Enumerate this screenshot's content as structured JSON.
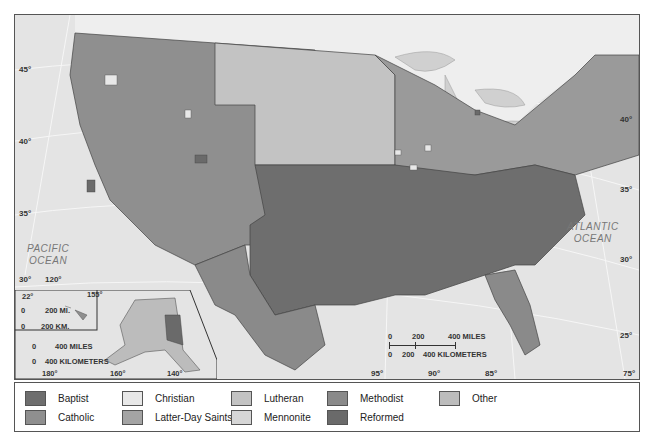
{
  "map": {
    "title": "Religious affiliation by county, United States",
    "ocean_labels": [
      {
        "line1": "PACIFIC",
        "line2": "OCEAN"
      },
      {
        "line1": "ATLANTIC",
        "line2": "OCEAN"
      }
    ],
    "latitude_labels_left": [
      "45°",
      "40°",
      "35°",
      "30°"
    ],
    "latitude_labels_right": [
      "40°",
      "35°",
      "30°",
      "25°"
    ],
    "longitude_labels_bottom": [
      "120°",
      "95°",
      "90°",
      "85°",
      "75°"
    ],
    "main_scale": {
      "miles_ticks": [
        "0",
        "200",
        "400 MILES"
      ],
      "km_ticks": [
        "0",
        "200",
        "400 KILOMETERS"
      ]
    },
    "inset": {
      "hawaii": {
        "lat_label": "22°",
        "lon_label": "155°",
        "miles": [
          "0",
          "200 MI."
        ],
        "km": [
          "0",
          "200 KM."
        ]
      },
      "alaska": {
        "miles": [
          "0",
          "400 MILES"
        ],
        "km": [
          "0",
          "400 KILOMETERS"
        ],
        "lon_labels": [
          "180°",
          "160°",
          "140°"
        ]
      }
    }
  },
  "legend": {
    "items": [
      {
        "label": "Baptist",
        "color": "#6e6e6e"
      },
      {
        "label": "Catholic",
        "color": "#8f8f8f"
      },
      {
        "label": "Christian",
        "color": "#e8e8e8"
      },
      {
        "label": "Latter-Day Saints",
        "color": "#a4a4a4"
      },
      {
        "label": "Lutheran",
        "color": "#c3c3c3"
      },
      {
        "label": "Mennonite",
        "color": "#d6d6d6"
      },
      {
        "label": "Methodist",
        "color": "#8a8a8a"
      },
      {
        "label": "Reformed",
        "color": "#6a6a6a"
      },
      {
        "label": "Other",
        "color": "#bcbcbc"
      }
    ]
  }
}
